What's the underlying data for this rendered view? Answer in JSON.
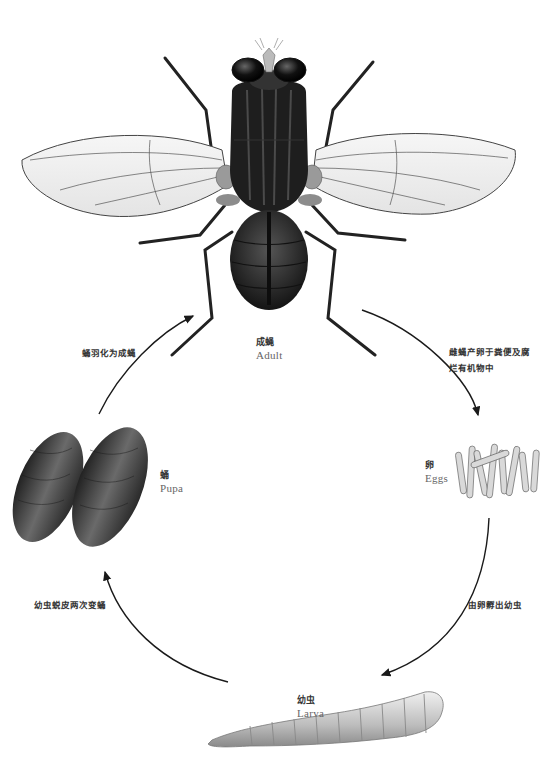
{
  "diagram": {
    "type": "life-cycle",
    "stages": [
      {
        "id": "adult",
        "zh": "成蝇",
        "en": "Adult"
      },
      {
        "id": "eggs",
        "zh": "卵",
        "en": "Eggs"
      },
      {
        "id": "larva",
        "zh": "幼虫",
        "en": "Larva"
      },
      {
        "id": "pupa",
        "zh": "蛹",
        "en": "Pupa"
      }
    ],
    "transitions": [
      {
        "from": "adult",
        "to": "eggs",
        "line1": "雌蝇产卵于粪便及腐",
        "line2": "烂有机物中"
      },
      {
        "from": "eggs",
        "to": "larva",
        "line1": "由卵孵出幼虫"
      },
      {
        "from": "larva",
        "to": "pupa",
        "line1": "幼虫蜕皮两次变蛹"
      },
      {
        "from": "pupa",
        "to": "adult",
        "line1": "蛹羽化为成蝇"
      }
    ]
  },
  "colors": {
    "background": "#ffffff",
    "arrow": "#1a1a1a",
    "fly_body": "#1e1e1e",
    "wing": "#eeeeee",
    "pupa": "#3a3a3a",
    "larva": "#cfcfcf"
  }
}
